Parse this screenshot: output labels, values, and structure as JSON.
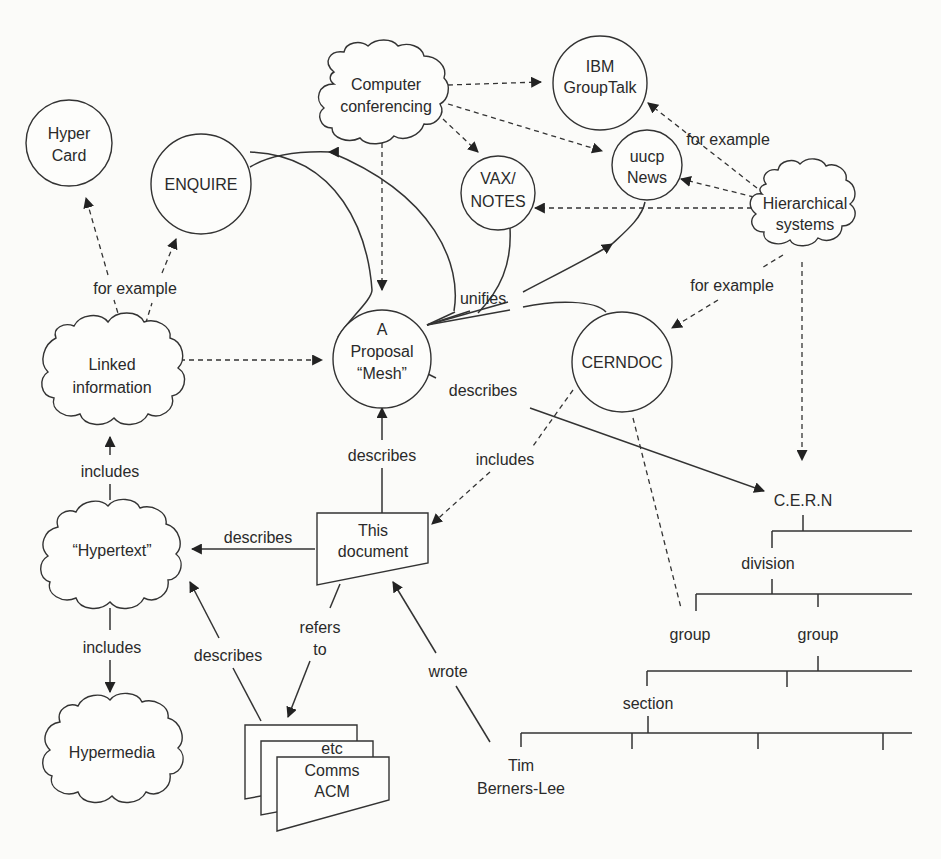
{
  "diagram": {
    "nodes": {
      "hypercard": {
        "lines": [
          "Hyper",
          "Card"
        ],
        "shape": "circle"
      },
      "enquire": {
        "lines": [
          "ENQUIRE"
        ],
        "shape": "circle"
      },
      "computer_conferencing": {
        "lines": [
          "Computer",
          "conferencing"
        ],
        "shape": "cloud"
      },
      "ibm_grouptalk": {
        "lines": [
          "IBM",
          "GroupTalk"
        ],
        "shape": "circle"
      },
      "uucp_news": {
        "lines": [
          "uucp",
          "News"
        ],
        "shape": "circle"
      },
      "vax_notes": {
        "lines": [
          "VAX/",
          "NOTES"
        ],
        "shape": "circle"
      },
      "hierarchical_systems": {
        "lines": [
          "Hierarchical",
          "systems"
        ],
        "shape": "cloud"
      },
      "linked_information": {
        "lines": [
          "Linked",
          "information"
        ],
        "shape": "cloud"
      },
      "proposal_mesh": {
        "lines": [
          "A",
          "Proposal",
          "“Mesh”"
        ],
        "shape": "circle"
      },
      "cerndoc": {
        "lines": [
          "CERNDOC"
        ],
        "shape": "circle"
      },
      "hypertext": {
        "lines": [
          "“Hypertext”"
        ],
        "shape": "cloud"
      },
      "this_document": {
        "lines": [
          "This",
          "document"
        ],
        "shape": "document"
      },
      "hypermedia": {
        "lines": [
          "Hypermedia"
        ],
        "shape": "cloud"
      },
      "comms_acm": {
        "lines": [
          "etc",
          "Comms",
          "ACM"
        ],
        "shape": "document-stack"
      },
      "tim_berners_lee": {
        "lines": [
          "Tim",
          "Berners-Lee"
        ],
        "shape": "text"
      }
    },
    "edge_labels": {
      "for_example_left": "for example",
      "for_example_right_top": "for example",
      "for_example_right_bottom": "for example",
      "unifies": "unifies",
      "describes_mesh_cern": "describes",
      "describes_doc_mesh": "describes",
      "includes_cerndoc_doc": "includes",
      "includes_hypertext_linked": "includes",
      "describes_doc_hypertext": "describes",
      "includes_hypertext_hypermedia": "includes",
      "describes_acm_hypertext": "describes",
      "refers_to_line1": "refers",
      "refers_to_line2": "to",
      "wrote": "wrote"
    },
    "org_tree": {
      "root": "C.E.R.N",
      "level1": "division",
      "level2": [
        "group",
        "group"
      ],
      "level3": "section"
    },
    "colors": {
      "background": "#fbfbf9",
      "ink": "#333333",
      "text": "#2a2a2a"
    }
  }
}
